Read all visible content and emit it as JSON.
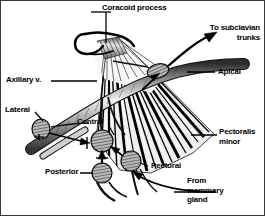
{
  "figure": {
    "background_color": "#ffffff",
    "border_color": "#3a3a3a",
    "ink_color": "#000000"
  },
  "labels": {
    "coracoid_process": "Coracoid process",
    "to_subclavian_trunks": "To subclavian\ntrunks",
    "apical": "Apical",
    "axillary_vein": "Axillary v.",
    "lateral": "Lateral",
    "central": "Central",
    "posterior": "Posterior",
    "pectoral": "Pectoral",
    "pectoralis_minor": "Pectoralis\nminor",
    "from_mammary_gland": "From\nmammary\ngland"
  },
  "anatomy": {
    "nodes": [
      {
        "name": "apical-node",
        "label": "Apical",
        "cx": 157,
        "cy": 70,
        "rx": 11,
        "ry": 7,
        "rotation": -14
      },
      {
        "name": "lateral-node",
        "label": "Lateral",
        "cx": 40,
        "cy": 128,
        "rx": 9,
        "ry": 10,
        "rotation": 0
      },
      {
        "name": "central-node",
        "label": "Central",
        "cx": 101,
        "cy": 140,
        "rx": 11,
        "ry": 11,
        "rotation": 0
      },
      {
        "name": "posterior-node",
        "label": "Posterior",
        "cx": 101,
        "cy": 172,
        "rx": 10,
        "ry": 10,
        "rotation": 0
      },
      {
        "name": "pectoral-node",
        "label": "Pectoral",
        "cx": 130,
        "cy": 160,
        "rx": 10,
        "ry": 10,
        "rotation": 0
      }
    ],
    "structures": [
      {
        "name": "coracoid-process",
        "kind": "bone-hook"
      },
      {
        "name": "pectoralis-minor-muscle",
        "kind": "striated-fan"
      },
      {
        "name": "axillary-vein",
        "kind": "shaded-tube"
      },
      {
        "name": "lymphatic-vessels",
        "kind": "vessel-lines"
      }
    ],
    "flow_arrows": [
      {
        "name": "arrow-to-subclavian",
        "direction": "up-right"
      },
      {
        "name": "arrow-into-apical",
        "direction": "up-right"
      },
      {
        "name": "arrow-lateral-to-central",
        "direction": "right"
      },
      {
        "name": "arrow-posterior-to-central",
        "direction": "up"
      },
      {
        "name": "arrow-pectoral-to-central",
        "direction": "up-left"
      },
      {
        "name": "arrow-from-mammary",
        "direction": "up-left"
      }
    ]
  }
}
